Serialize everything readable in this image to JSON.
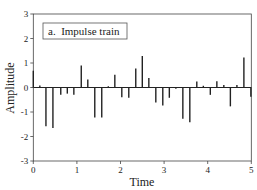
{
  "chart_data": {
    "type": "bar",
    "subtype": "stem",
    "title": "",
    "legend": {
      "label": "a.  Impulse train",
      "position": "upper-left"
    },
    "xlabel": "Time",
    "ylabel": "Amplitude",
    "xlim": [
      0,
      5
    ],
    "ylim": [
      -3,
      3
    ],
    "xticks": [
      0,
      1,
      2,
      3,
      4,
      5
    ],
    "yticks": [
      -3,
      -2,
      -1,
      0,
      1,
      2,
      3
    ],
    "grid": false,
    "baseline": 0,
    "x": [
      0.0,
      0.15,
      0.29,
      0.45,
      0.63,
      0.78,
      0.93,
      1.1,
      1.25,
      1.41,
      1.57,
      1.72,
      1.87,
      2.03,
      2.19,
      2.35,
      2.5,
      2.65,
      2.81,
      2.97,
      3.12,
      3.27,
      3.43,
      3.59,
      3.75,
      3.9,
      4.06,
      4.21,
      4.37,
      4.52,
      4.67,
      4.83,
      4.99
    ],
    "values": [
      0.68,
      0.08,
      -1.58,
      -1.65,
      -0.3,
      -0.25,
      -0.3,
      0.9,
      0.33,
      -1.22,
      -1.22,
      0.05,
      0.52,
      -0.4,
      -0.42,
      0.78,
      1.29,
      0.39,
      -0.61,
      -0.73,
      -0.42,
      -0.05,
      -1.28,
      -1.42,
      0.25,
      0.07,
      -0.3,
      0.26,
      0.1,
      -0.77,
      0.1,
      1.22,
      -0.38
    ],
    "colors": {
      "stem": "#222222",
      "axis": "#444444",
      "background": "#ffffff"
    }
  }
}
